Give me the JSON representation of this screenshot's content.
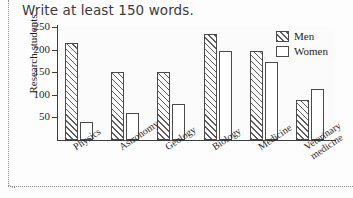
{
  "page": {
    "heading": "Write at least 150 words."
  },
  "legend": {
    "position": "top-right",
    "entries": [
      {
        "label": "Men",
        "style": "hatched"
      },
      {
        "label": "Women",
        "style": "white"
      }
    ]
  },
  "axes": {
    "ylabel": "Research students",
    "yticks": [
      "50",
      "100",
      "150",
      "200",
      "250"
    ],
    "ymin": 0,
    "ymax": 250
  },
  "chart_data": {
    "type": "bar",
    "title": "",
    "xlabel": "",
    "ylabel": "Research students",
    "ylim": [
      0,
      250
    ],
    "yticks": [
      50,
      100,
      150,
      200,
      250
    ],
    "grid": true,
    "legend_position": "top-right",
    "categories": [
      "Physics",
      "Astronomy",
      "Geology",
      "Biology",
      "Medicine",
      "Veterinary medicine"
    ],
    "series": [
      {
        "name": "Men",
        "values": [
          215,
          150,
          150,
          235,
          198,
          88
        ]
      },
      {
        "name": "Women",
        "values": [
          40,
          60,
          80,
          198,
          173,
          113
        ]
      }
    ]
  }
}
